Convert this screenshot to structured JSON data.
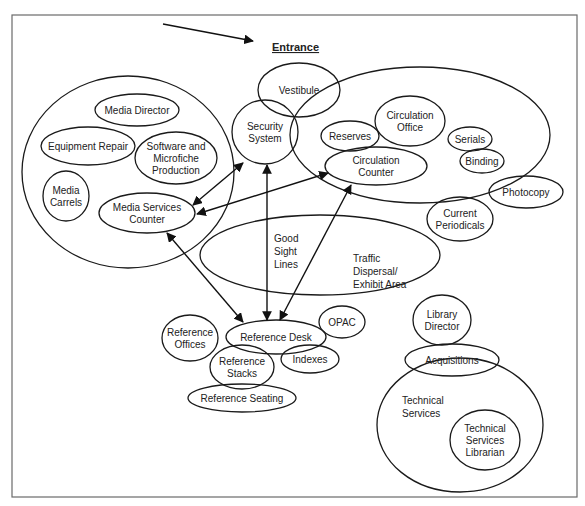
{
  "title": "Entrance",
  "frame": {
    "x": 12,
    "y": 15,
    "w": 565,
    "h": 482
  },
  "colors": {
    "stroke": "#1a1a1a",
    "frame": "#6a6a6a",
    "text": "#222222",
    "background": "#ffffff"
  },
  "zones": [
    {
      "id": "media-services-zone",
      "label": "",
      "cx": 128,
      "cy": 172,
      "rx": 106,
      "ry": 96
    },
    {
      "id": "circulation-zone",
      "label": "",
      "cx": 420,
      "cy": 135,
      "rx": 130,
      "ry": 68
    },
    {
      "id": "traffic-dispersal",
      "label": "Traffic Dispersal/ Exhibit Area",
      "cx": 320,
      "cy": 255,
      "rx": 120,
      "ry": 40
    },
    {
      "id": "technical-services",
      "label": "Technical Services",
      "cx": 460,
      "cy": 425,
      "rx": 83,
      "ry": 67
    }
  ],
  "nodes": [
    {
      "id": "vestibule",
      "lines": [
        "Vestibule"
      ],
      "cx": 299,
      "cy": 90,
      "rx": 41,
      "ry": 27
    },
    {
      "id": "security-system",
      "lines": [
        "Security",
        "System"
      ],
      "cx": 265,
      "cy": 132,
      "rx": 33,
      "ry": 32
    },
    {
      "id": "media-director",
      "lines": [
        "Media Director"
      ],
      "cx": 137,
      "cy": 110,
      "rx": 42,
      "ry": 16
    },
    {
      "id": "equipment-repair",
      "lines": [
        "Equipment Repair"
      ],
      "cx": 88,
      "cy": 146,
      "rx": 47,
      "ry": 19
    },
    {
      "id": "software-microfiche",
      "lines": [
        "Software and",
        "Microfiche",
        "Production"
      ],
      "cx": 176,
      "cy": 158,
      "rx": 41,
      "ry": 26
    },
    {
      "id": "media-carrels",
      "lines": [
        "Media",
        "Carrels"
      ],
      "cx": 66,
      "cy": 196,
      "rx": 23,
      "ry": 25
    },
    {
      "id": "media-services-counter",
      "lines": [
        "Media Services",
        "Counter"
      ],
      "cx": 147,
      "cy": 213,
      "rx": 48,
      "ry": 20
    },
    {
      "id": "circulation-office",
      "lines": [
        "Circulation",
        "Office"
      ],
      "cx": 410,
      "cy": 121,
      "rx": 35,
      "ry": 25
    },
    {
      "id": "reserves",
      "lines": [
        "Reserves"
      ],
      "cx": 350,
      "cy": 136,
      "rx": 29,
      "ry": 15
    },
    {
      "id": "circulation-counter",
      "lines": [
        "Circulation",
        "Counter"
      ],
      "cx": 376,
      "cy": 166,
      "rx": 51,
      "ry": 19
    },
    {
      "id": "serials",
      "lines": [
        "Serials"
      ],
      "cx": 470,
      "cy": 139,
      "rx": 22,
      "ry": 12
    },
    {
      "id": "binding",
      "lines": [
        "Binding"
      ],
      "cx": 482,
      "cy": 161,
      "rx": 22,
      "ry": 12
    },
    {
      "id": "photocopy",
      "lines": [
        "Photocopy"
      ],
      "cx": 526,
      "cy": 192,
      "rx": 37,
      "ry": 16
    },
    {
      "id": "current-periodicals",
      "lines": [
        "Current",
        "Periodicals"
      ],
      "cx": 460,
      "cy": 219,
      "rx": 33,
      "ry": 22
    },
    {
      "id": "reference-desk",
      "lines": [
        "Reference Desk"
      ],
      "cx": 276,
      "cy": 337,
      "rx": 50,
      "ry": 17
    },
    {
      "id": "opac",
      "lines": [
        "OPAC"
      ],
      "cx": 342,
      "cy": 322,
      "rx": 23,
      "ry": 16
    },
    {
      "id": "reference-offices",
      "lines": [
        "Reference",
        "Offices"
      ],
      "cx": 190,
      "cy": 338,
      "rx": 28,
      "ry": 23
    },
    {
      "id": "reference-stacks",
      "lines": [
        "Reference",
        "Stacks"
      ],
      "cx": 242,
      "cy": 367,
      "rx": 32,
      "ry": 22
    },
    {
      "id": "indexes",
      "lines": [
        "Indexes"
      ],
      "cx": 310,
      "cy": 359,
      "rx": 29,
      "ry": 14
    },
    {
      "id": "reference-seating",
      "lines": [
        "Reference Seating"
      ],
      "cx": 242,
      "cy": 398,
      "rx": 54,
      "ry": 14
    },
    {
      "id": "library-director",
      "lines": [
        "Library",
        "Director"
      ],
      "cx": 442,
      "cy": 320,
      "rx": 29,
      "ry": 25
    },
    {
      "id": "acquisitions",
      "lines": [
        "Acquisitions"
      ],
      "cx": 452,
      "cy": 360,
      "rx": 47,
      "ry": 16
    },
    {
      "id": "technical-services-librarian",
      "lines": [
        "Technical",
        "Services",
        "Librarian"
      ],
      "cx": 485,
      "cy": 440,
      "rx": 35,
      "ry": 30
    }
  ],
  "labels": {
    "good_sight_lines": [
      "Good",
      "Sight",
      "Lines"
    ],
    "traffic_dispersal": [
      "Traffic",
      "Dispersal/",
      "Exhibit Area"
    ],
    "technical_services": [
      "Technical",
      "Services"
    ]
  },
  "arrows": [
    {
      "id": "entrance-arrow",
      "from": [
        163,
        24
      ],
      "to": [
        253,
        41
      ],
      "type": "single"
    },
    {
      "id": "media-counter-to-security",
      "from": [
        193,
        205
      ],
      "to": [
        243,
        163
      ],
      "type": "double"
    },
    {
      "id": "media-counter-to-circulation-counter",
      "from": [
        197,
        214
      ],
      "to": [
        328,
        173
      ],
      "type": "double"
    },
    {
      "id": "media-counter-to-reference-desk",
      "from": [
        167,
        233
      ],
      "to": [
        243,
        322
      ],
      "type": "double"
    },
    {
      "id": "security-to-reference-desk",
      "from": [
        267,
        165
      ],
      "to": [
        267,
        320
      ],
      "type": "double"
    },
    {
      "id": "circulation-counter-to-reference-desk",
      "from": [
        351,
        185
      ],
      "to": [
        280,
        320
      ],
      "type": "double"
    }
  ]
}
